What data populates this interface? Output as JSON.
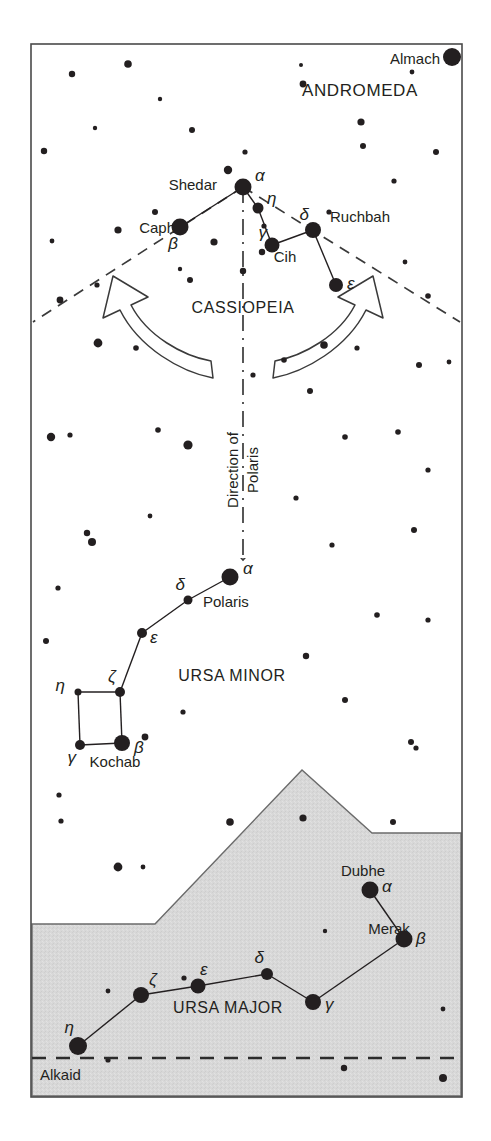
{
  "figure": {
    "kind": "star-chart",
    "title_text_visible": false,
    "frame": {
      "x": 31,
      "y": 44,
      "width": 431,
      "height": 1053,
      "stroke": "#4a4a4a"
    },
    "colors": {
      "background": "#ffffff",
      "ground_fill": "#d6d6d6",
      "ink": "#231f20",
      "frame": "#555555",
      "dash": "#3a3a3a"
    }
  },
  "constellation_labels": [
    {
      "id": "andromeda",
      "text": "ANDROMEDA",
      "x": 360,
      "y": 96,
      "size": 17,
      "anchor": "middle",
      "spacing": 0.6
    },
    {
      "id": "cassiopeia",
      "text": "CASSIOPEIA",
      "x": 243,
      "y": 313,
      "size": 16,
      "anchor": "middle",
      "spacing": 0.6
    },
    {
      "id": "ursa-minor",
      "text": "URSA MINOR",
      "x": 232,
      "y": 681,
      "size": 16,
      "anchor": "middle",
      "spacing": 0.6
    },
    {
      "id": "ursa-major",
      "text": "URSA MAJOR",
      "x": 228,
      "y": 1013,
      "size": 16,
      "anchor": "middle",
      "spacing": 0.6
    }
  ],
  "direction_note": {
    "line1": "Direction of",
    "line2": "Polaris",
    "x1": 238,
    "y1": 470,
    "x2": 258,
    "y2": 470,
    "size": 15,
    "rotation": -90
  },
  "named_stars": [
    {
      "id": "almach",
      "name": "Almach",
      "greek": "",
      "cx": 452,
      "cy": 57,
      "r": 9,
      "label_x": 440,
      "label_y": 64,
      "label_anchor": "end",
      "label_size": 15
    },
    {
      "id": "shedar",
      "name": "Shedar",
      "greek": "β-adjacent",
      "cx": 0,
      "cy": 0,
      "r": 0,
      "label_x": 217,
      "label_y": 190,
      "label_anchor": "end",
      "label_size": 15
    },
    {
      "id": "caph",
      "name": "Caph",
      "greek": "",
      "cx": 0,
      "cy": 0,
      "r": 0,
      "label_x": 175,
      "label_y": 233,
      "label_anchor": "end",
      "label_size": 15
    },
    {
      "id": "cih",
      "name": "Cih",
      "greek": "",
      "cx": 0,
      "cy": 0,
      "r": 0,
      "label_x": 285,
      "label_y": 262,
      "label_anchor": "middle",
      "label_size": 15
    },
    {
      "id": "ruchbah",
      "name": "Ruchbah",
      "greek": "",
      "cx": 0,
      "cy": 0,
      "r": 0,
      "label_x": 330,
      "label_y": 222,
      "label_anchor": "start",
      "label_size": 15
    },
    {
      "id": "polaris",
      "name": "Polaris",
      "greek": "",
      "cx": 0,
      "cy": 0,
      "r": 0,
      "label_x": 203,
      "label_y": 607,
      "label_anchor": "start",
      "label_size": 15
    },
    {
      "id": "kochab",
      "name": "Kochab",
      "greek": "",
      "cx": 0,
      "cy": 0,
      "r": 0,
      "label_x": 115,
      "label_y": 767,
      "label_anchor": "middle",
      "label_size": 15
    },
    {
      "id": "dubhe",
      "name": "Dubhe",
      "greek": "",
      "cx": 0,
      "cy": 0,
      "r": 0,
      "label_x": 363,
      "label_y": 876,
      "label_anchor": "middle",
      "label_size": 15
    },
    {
      "id": "merak",
      "name": "Merak",
      "greek": "",
      "cx": 0,
      "cy": 0,
      "r": 0,
      "label_x": 389,
      "label_y": 934,
      "label_anchor": "middle",
      "label_size": 15
    },
    {
      "id": "alkaid",
      "name": "Alkaid",
      "greek": "",
      "cx": 0,
      "cy": 0,
      "r": 0,
      "label_x": 40,
      "label_y": 1080,
      "label_anchor": "start",
      "label_size": 15
    }
  ],
  "chart_data": {
    "type": "scatter",
    "constellations": [
      {
        "name": "CASSIOPEIA",
        "stars": [
          {
            "bayer": "α",
            "proper": "Shedar",
            "x": 243,
            "y": 187,
            "r": 8.5,
            "label_dx": 12,
            "label_dy": -6
          },
          {
            "bayer": "β",
            "proper": "Caph",
            "x": 180,
            "y": 227,
            "r": 8.5,
            "label_dx": -2,
            "label_dy": 22
          },
          {
            "bayer": "η",
            "proper": "",
            "x": 258,
            "y": 208,
            "r": 5.5,
            "label_dx": 9,
            "label_dy": -4
          },
          {
            "bayer": "γ",
            "proper": "Cih",
            "x": 272,
            "y": 245,
            "r": 7.5,
            "label_dx": -5,
            "label_dy": -7
          },
          {
            "bayer": "δ",
            "proper": "Ruchbah",
            "x": 313,
            "y": 230,
            "r": 8,
            "label_dx": -4,
            "label_dy": -10
          },
          {
            "bayer": "ε",
            "proper": "",
            "x": 336,
            "y": 285,
            "r": 7,
            "label_dx": 11,
            "label_dy": 4
          }
        ],
        "lines": [
          [
            1,
            0
          ],
          [
            0,
            2
          ],
          [
            2,
            3
          ],
          [
            3,
            4
          ],
          [
            4,
            5
          ]
        ]
      },
      {
        "name": "URSA MINOR",
        "stars": [
          {
            "bayer": "α",
            "proper": "Polaris",
            "x": 230,
            "y": 577,
            "r": 8.5,
            "label_dx": 13,
            "label_dy": -3
          },
          {
            "bayer": "δ",
            "proper": "",
            "x": 188,
            "y": 600,
            "r": 4.5,
            "label_dx": -3,
            "label_dy": -10
          },
          {
            "bayer": "ε",
            "proper": "",
            "x": 142,
            "y": 633,
            "r": 5,
            "label_dx": 8,
            "label_dy": 10
          },
          {
            "bayer": "ζ",
            "proper": "",
            "x": 120,
            "y": 692,
            "r": 5,
            "label_dx": -4,
            "label_dy": -10
          },
          {
            "bayer": "η",
            "proper": "",
            "x": 78,
            "y": 692,
            "r": 3.5,
            "label_dx": -13,
            "label_dy": -1
          },
          {
            "bayer": "γ",
            "proper": "",
            "x": 80,
            "y": 745,
            "r": 5,
            "label_dx": -4,
            "label_dy": 18
          },
          {
            "bayer": "β",
            "proper": "Kochab",
            "x": 122,
            "y": 743,
            "r": 8,
            "label_dx": 12,
            "label_dy": 10
          }
        ],
        "lines": [
          [
            0,
            1
          ],
          [
            1,
            2
          ],
          [
            2,
            3
          ],
          [
            3,
            4
          ],
          [
            4,
            5
          ],
          [
            5,
            6
          ],
          [
            6,
            3
          ]
        ]
      },
      {
        "name": "URSA MAJOR",
        "stars": [
          {
            "bayer": "α",
            "proper": "Dubhe",
            "x": 370,
            "y": 890,
            "r": 8.5,
            "label_dx": 12,
            "label_dy": 2
          },
          {
            "bayer": "β",
            "proper": "Merak",
            "x": 404,
            "y": 939,
            "r": 8.5,
            "label_dx": 12,
            "label_dy": 5
          },
          {
            "bayer": "γ",
            "proper": "",
            "x": 313,
            "y": 1002,
            "r": 8,
            "label_dx": 12,
            "label_dy": 8
          },
          {
            "bayer": "δ",
            "proper": "",
            "x": 267,
            "y": 974,
            "r": 6,
            "label_dx": -3,
            "label_dy": -11
          },
          {
            "bayer": "ε",
            "proper": "",
            "x": 198,
            "y": 986,
            "r": 7.5,
            "label_dx": 2,
            "label_dy": -11
          },
          {
            "bayer": "ζ",
            "proper": "",
            "x": 141,
            "y": 995,
            "r": 8,
            "label_dx": 8,
            "label_dy": -10
          },
          {
            "bayer": "η",
            "proper": "Alkaid",
            "x": 78,
            "y": 1046,
            "r": 9,
            "label_dx": -4,
            "label_dy": -13
          }
        ],
        "lines": [
          [
            0,
            1
          ],
          [
            1,
            2
          ],
          [
            2,
            3
          ],
          [
            3,
            4
          ],
          [
            4,
            5
          ],
          [
            5,
            6
          ]
        ]
      }
    ],
    "field_stars": [
      {
        "x": 72,
        "y": 74,
        "r": 3.2
      },
      {
        "x": 128,
        "y": 64,
        "r": 3.8
      },
      {
        "x": 160,
        "y": 99,
        "r": 2.2
      },
      {
        "x": 303,
        "y": 84,
        "r": 3.4
      },
      {
        "x": 301,
        "y": 65,
        "r": 2.0
      },
      {
        "x": 361,
        "y": 122,
        "r": 3.6
      },
      {
        "x": 363,
        "y": 146,
        "r": 3.0
      },
      {
        "x": 412,
        "y": 72,
        "r": 2.4
      },
      {
        "x": 44,
        "y": 151,
        "r": 3.2
      },
      {
        "x": 95,
        "y": 128,
        "r": 2.2
      },
      {
        "x": 192,
        "y": 130,
        "r": 3.0
      },
      {
        "x": 228,
        "y": 170,
        "r": 4.2
      },
      {
        "x": 245,
        "y": 152,
        "r": 2.6
      },
      {
        "x": 155,
        "y": 212,
        "r": 3.0
      },
      {
        "x": 118,
        "y": 230,
        "r": 3.6
      },
      {
        "x": 52,
        "y": 241,
        "r": 2.4
      },
      {
        "x": 264,
        "y": 226,
        "r": 2.6
      },
      {
        "x": 329,
        "y": 212,
        "r": 2.6
      },
      {
        "x": 262,
        "y": 252,
        "r": 3.2
      },
      {
        "x": 214,
        "y": 242,
        "r": 3.6
      },
      {
        "x": 394,
        "y": 181,
        "r": 2.6
      },
      {
        "x": 436,
        "y": 152,
        "r": 3.0
      },
      {
        "x": 180,
        "y": 269,
        "r": 2.2
      },
      {
        "x": 190,
        "y": 280,
        "r": 3.0
      },
      {
        "x": 243,
        "y": 271,
        "r": 3.2
      },
      {
        "x": 97,
        "y": 285,
        "r": 2.6
      },
      {
        "x": 60,
        "y": 300,
        "r": 3.4
      },
      {
        "x": 405,
        "y": 262,
        "r": 2.4
      },
      {
        "x": 428,
        "y": 296,
        "r": 2.8
      },
      {
        "x": 98,
        "y": 343,
        "r": 4.4
      },
      {
        "x": 136,
        "y": 348,
        "r": 2.8
      },
      {
        "x": 284,
        "y": 360,
        "r": 2.8
      },
      {
        "x": 310,
        "y": 391,
        "r": 3.0
      },
      {
        "x": 324,
        "y": 345,
        "r": 3.8
      },
      {
        "x": 357,
        "y": 348,
        "r": 2.6
      },
      {
        "x": 253,
        "y": 375,
        "r": 2.6
      },
      {
        "x": 419,
        "y": 365,
        "r": 3.0
      },
      {
        "x": 449,
        "y": 362,
        "r": 2.4
      },
      {
        "x": 51,
        "y": 437,
        "r": 4.2
      },
      {
        "x": 70,
        "y": 435,
        "r": 2.6
      },
      {
        "x": 158,
        "y": 430,
        "r": 2.8
      },
      {
        "x": 188,
        "y": 445,
        "r": 4.6
      },
      {
        "x": 345,
        "y": 437,
        "r": 2.8
      },
      {
        "x": 398,
        "y": 432,
        "r": 2.8
      },
      {
        "x": 87,
        "y": 533,
        "r": 3.2
      },
      {
        "x": 92,
        "y": 542,
        "r": 4.0
      },
      {
        "x": 150,
        "y": 516,
        "r": 2.4
      },
      {
        "x": 296,
        "y": 498,
        "r": 2.6
      },
      {
        "x": 428,
        "y": 470,
        "r": 2.6
      },
      {
        "x": 414,
        "y": 530,
        "r": 3.0
      },
      {
        "x": 332,
        "y": 545,
        "r": 2.6
      },
      {
        "x": 58,
        "y": 588,
        "r": 2.6
      },
      {
        "x": 46,
        "y": 641,
        "r": 3.0
      },
      {
        "x": 306,
        "y": 656,
        "r": 3.2
      },
      {
        "x": 377,
        "y": 615,
        "r": 2.8
      },
      {
        "x": 428,
        "y": 620,
        "r": 2.6
      },
      {
        "x": 145,
        "y": 737,
        "r": 3.4
      },
      {
        "x": 183,
        "y": 712,
        "r": 2.6
      },
      {
        "x": 345,
        "y": 700,
        "r": 3.0
      },
      {
        "x": 411,
        "y": 742,
        "r": 3.0
      },
      {
        "x": 59,
        "y": 795,
        "r": 2.6
      },
      {
        "x": 61,
        "y": 821,
        "r": 2.6
      },
      {
        "x": 118,
        "y": 867,
        "r": 4.4
      },
      {
        "x": 143,
        "y": 867,
        "r": 2.4
      },
      {
        "x": 230,
        "y": 822,
        "r": 3.8
      },
      {
        "x": 303,
        "y": 818,
        "r": 3.6
      },
      {
        "x": 393,
        "y": 822,
        "r": 3.0
      },
      {
        "x": 416,
        "y": 748,
        "r": 2.6
      },
      {
        "x": 108,
        "y": 991,
        "r": 2.4
      },
      {
        "x": 184,
        "y": 978,
        "r": 2.6
      },
      {
        "x": 325,
        "y": 931,
        "r": 2.2
      },
      {
        "x": 108,
        "y": 1060,
        "r": 2.6
      },
      {
        "x": 344,
        "y": 1068,
        "r": 3.2
      },
      {
        "x": 443,
        "y": 1078,
        "r": 4.0
      },
      {
        "x": 443,
        "y": 1009,
        "r": 2.4
      }
    ],
    "ground_polygon": [
      [
        32,
        924
      ],
      [
        155,
        924
      ],
      [
        302,
        770
      ],
      [
        372,
        833
      ],
      [
        461,
        833
      ],
      [
        461,
        1096
      ],
      [
        32,
        1096
      ]
    ],
    "horizon_dashed_line": {
      "x1": 32,
      "y1": 1058,
      "x2": 461,
      "y2": 1058
    },
    "guide_lines": [
      {
        "id": "left-wedge",
        "x1": 243,
        "y1": 187,
        "x2": 33,
        "y2": 322,
        "style": "dashed"
      },
      {
        "id": "right-wedge",
        "x1": 243,
        "y1": 187,
        "x2": 460,
        "y2": 322,
        "style": "dashed"
      },
      {
        "id": "polaris-axis",
        "x1": 243,
        "y1": 187,
        "x2": 243,
        "y2": 560,
        "style": "dash-dot",
        "arrow": true
      }
    ],
    "curved_arrows": [
      {
        "id": "arrow-left",
        "direction": "up-left",
        "tip_x": 113,
        "tip_y": 303
      },
      {
        "id": "arrow-right",
        "direction": "up-right",
        "tip_x": 360,
        "tip_y": 303
      }
    ]
  }
}
